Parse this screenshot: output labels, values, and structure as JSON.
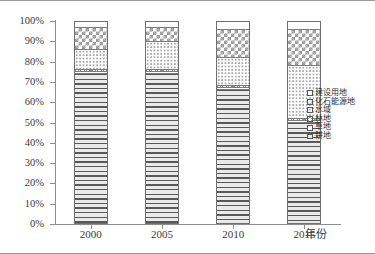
{
  "chart_data": {
    "type": "bar",
    "subtype": "stacked-100-percent",
    "title": "",
    "xlabel": "年份",
    "ylabel": "",
    "categories": [
      "2000",
      "2005",
      "2010",
      "2015"
    ],
    "ylim": [
      0,
      100
    ],
    "ytick_labels": [
      "0%",
      "10%",
      "20%",
      "30%",
      "40%",
      "50%",
      "60%",
      "70%",
      "80%",
      "90%",
      "100%"
    ],
    "ytick_values": [
      0,
      10,
      20,
      30,
      40,
      50,
      60,
      70,
      80,
      90,
      100
    ],
    "grid": false,
    "legend_position": "right",
    "stack_order_bottom_to_top": [
      "耕地",
      "草地",
      "林地",
      "水域",
      "化石能源地",
      "建设用地"
    ],
    "series": [
      {
        "name": "耕地",
        "pattern": "horizontal-lines",
        "values": [
          74,
          74,
          66,
          50
        ]
      },
      {
        "name": "草地",
        "pattern": "blank",
        "values": [
          1,
          1,
          1,
          1
        ]
      },
      {
        "name": "林地",
        "pattern": "cross-hatch",
        "values": [
          1,
          1,
          1,
          1
        ]
      },
      {
        "name": "水域",
        "pattern": "fine-dots",
        "values": [
          10,
          14,
          14,
          26
        ]
      },
      {
        "name": "化石能源地",
        "pattern": "checkerboard",
        "values": [
          11,
          7,
          14,
          18
        ]
      },
      {
        "name": "建设用地",
        "pattern": "blank",
        "values": [
          3,
          3,
          4,
          4
        ]
      }
    ]
  },
  "legend": {
    "items": [
      {
        "label": "建设用地",
        "pattern": "blank"
      },
      {
        "label": "化石能源地",
        "pattern": "checkerboard"
      },
      {
        "label": "水域",
        "pattern": "fine-dots"
      },
      {
        "label": "林地",
        "pattern": "cross-hatch"
      },
      {
        "label": "草地",
        "pattern": "blank"
      },
      {
        "label": "耕地",
        "pattern": "horizontal-lines"
      }
    ]
  },
  "colors": {
    "axis": "#8d8d8d",
    "frame": "#9a9a9a",
    "text": "#3a3a3a",
    "pattern_ink": "#6f6f6f",
    "background": "#ffffff"
  }
}
